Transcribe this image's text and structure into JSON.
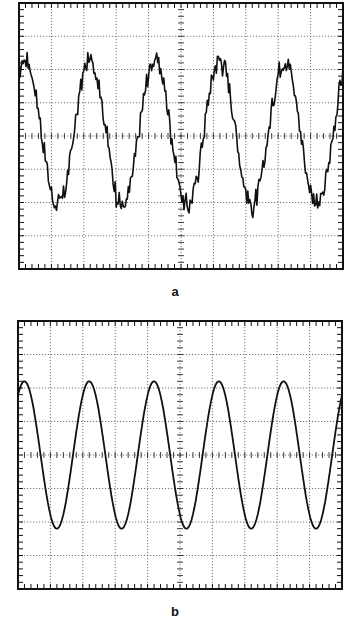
{
  "figure": {
    "panels": [
      {
        "id": "a",
        "label": "a"
      },
      {
        "id": "b",
        "label": "b"
      }
    ]
  },
  "colors": {
    "trace": "#111111",
    "grid": "#555555",
    "frame": "#111111"
  },
  "chart_data": [
    {
      "type": "line",
      "title": "a",
      "description": "Oscilloscope trace, noisy periodic waveform",
      "grid": {
        "divisions_x": 10,
        "divisions_y": 8,
        "minor_ticks_per_division": 5,
        "style": "dotted"
      },
      "xlabel": "",
      "ylabel": "",
      "xlim": [
        0,
        10
      ],
      "ylim": [
        -4,
        4
      ],
      "series": [
        {
          "name": "noisy signal",
          "cycles_visible": 5,
          "amplitude_div": 2.2,
          "offset_div": 0.1,
          "period_div": 2.0,
          "noise": "high-frequency ripple, peaks jagged"
        }
      ]
    },
    {
      "type": "line",
      "title": "b",
      "description": "Oscilloscope trace, clean sinusoid",
      "grid": {
        "divisions_x": 10,
        "divisions_y": 8,
        "minor_ticks_per_division": 5,
        "style": "dotted"
      },
      "xlabel": "",
      "ylabel": "",
      "xlim": [
        0,
        10
      ],
      "ylim": [
        -4,
        4
      ],
      "series": [
        {
          "name": "filtered sine",
          "cycles_visible": 5,
          "amplitude_div": 2.2,
          "offset_div": 0.0,
          "period_div": 2.0,
          "noise": "none"
        }
      ]
    }
  ]
}
